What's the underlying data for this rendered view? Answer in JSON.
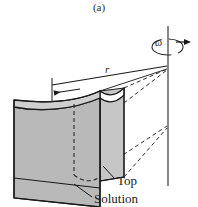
{
  "figure": {
    "caption": "(a)",
    "labels": {
      "angular_velocity": "ω",
      "radius": "r",
      "top": "Top",
      "solution": "Solution"
    },
    "icon_names": {
      "rotation_arrow": "rotation-arrow-icon",
      "dimension_arrow": "dimension-arrow-icon",
      "axis": "rotation-axis-line"
    },
    "colors": {
      "background": "#ffffff",
      "solid_fill": "#b9b9b9",
      "solid_fill_dark": "#a8a8a8",
      "solid_fill_light": "#c8c8c8",
      "stroke": "#1a1a1a",
      "dashed_stroke": "#303030",
      "text": "#1a1a1a"
    }
  }
}
